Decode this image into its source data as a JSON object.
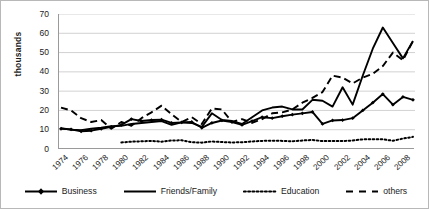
{
  "chart_data": {
    "type": "line",
    "title": "",
    "xlabel": "",
    "ylabel": "thousands",
    "ylim": [
      0,
      70
    ],
    "ytick_step": 10,
    "yticks": [
      "70",
      "60",
      "50",
      "40",
      "30",
      "20",
      "10",
      "0"
    ],
    "grid": true,
    "grid_axis": "y",
    "legend_position": "bottom",
    "x": [
      1974,
      1975,
      1976,
      1977,
      1978,
      1979,
      1980,
      1981,
      1982,
      1983,
      1984,
      1985,
      1986,
      1987,
      1988,
      1989,
      1990,
      1991,
      1992,
      1993,
      1994,
      1995,
      1996,
      1997,
      1998,
      1999,
      2000,
      2001,
      2002,
      2003,
      2004,
      2005,
      2006,
      2007,
      2008,
      2009
    ],
    "xtick_labels": [
      "1974",
      "1976",
      "1978",
      "1980",
      "1982",
      "1984",
      "1986",
      "1988",
      "1990",
      "1992",
      "1994",
      "1996",
      "1998",
      "2000",
      "2002",
      "2004",
      "2006",
      "2008"
    ],
    "series": [
      {
        "name": "Business",
        "style": "solid-marker",
        "marker": "diamond",
        "color": "#000000",
        "values": [
          10.5,
          10.2,
          9.2,
          9.5,
          10.5,
          11.5,
          12.5,
          15.5,
          14.5,
          15.0,
          15.2,
          13.5,
          13.8,
          14.0,
          11.0,
          13.5,
          14.8,
          14.0,
          12.5,
          14.5,
          16.5,
          16.0,
          17.0,
          17.8,
          18.5,
          19.2,
          13.0,
          14.8,
          15.0,
          16.0,
          20.0,
          24.0,
          28.5,
          23.0,
          27.0,
          25.5
        ]
      },
      {
        "name": "Friends/Family",
        "style": "solid",
        "color": "#000000",
        "values": [
          10.8,
          10.0,
          9.8,
          10.5,
          11.0,
          11.8,
          12.0,
          13.0,
          13.5,
          14.0,
          14.5,
          12.5,
          13.8,
          13.5,
          11.5,
          18.5,
          15.0,
          14.5,
          13.0,
          16.5,
          20.0,
          21.5,
          22.0,
          20.5,
          20.5,
          25.5,
          25.0,
          22.0,
          32.0,
          23.0,
          38.0,
          52.0,
          63.0,
          55.0,
          47.0,
          56.0
        ]
      },
      {
        "name": "Education",
        "style": "dotted",
        "color": "#000000",
        "values": [
          null,
          null,
          null,
          null,
          null,
          null,
          3.4,
          3.8,
          4.0,
          4.2,
          3.8,
          4.4,
          4.5,
          3.5,
          3.3,
          3.9,
          3.6,
          3.4,
          3.5,
          3.9,
          4.2,
          4.3,
          4.2,
          4.0,
          4.4,
          4.7,
          4.1,
          4.2,
          4.1,
          4.4,
          5.0,
          5.1,
          5.0,
          4.3,
          5.4,
          6.3
        ]
      },
      {
        "name": "others",
        "style": "dashed",
        "color": "#000000",
        "values": [
          21.5,
          20.0,
          16.0,
          14.0,
          15.0,
          10.5,
          14.0,
          12.0,
          16.0,
          19.0,
          22.5,
          18.0,
          14.0,
          16.5,
          13.0,
          21.0,
          20.5,
          14.0,
          15.5,
          13.5,
          15.5,
          18.5,
          19.0,
          20.5,
          24.0,
          26.5,
          29.5,
          38.0,
          37.0,
          34.0,
          37.0,
          39.0,
          43.0,
          50.0,
          46.0,
          56.0
        ]
      }
    ]
  },
  "legend": {
    "items": [
      {
        "label": "Business",
        "swatch": "line-diamond-marker"
      },
      {
        "label": "Friends/Family",
        "swatch": "line-solid"
      },
      {
        "label": "Education",
        "swatch": "line-dotted"
      },
      {
        "label": "others",
        "swatch": "line-dashed"
      }
    ]
  }
}
